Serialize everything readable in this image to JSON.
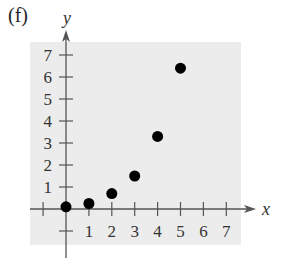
{
  "panel_label": "(f)",
  "colors": {
    "background": "#ffffff",
    "plot_area": "#ececec",
    "axis": "#555555",
    "points": "#000000"
  },
  "chart_data": {
    "type": "scatter",
    "title": "",
    "xlabel": "x",
    "ylabel": "y",
    "x": [
      0,
      1,
      2,
      3,
      4,
      5
    ],
    "y": [
      0.1,
      0.25,
      0.7,
      1.5,
      3.3,
      6.4
    ],
    "x_ticks": [
      1,
      2,
      3,
      4,
      5,
      6,
      7
    ],
    "y_ticks": [
      1,
      2,
      3,
      4,
      5,
      6,
      7
    ],
    "xlim": [
      -1.5,
      7.5
    ],
    "ylim": [
      -1.5,
      7.5
    ],
    "grid": false,
    "legend": null
  }
}
